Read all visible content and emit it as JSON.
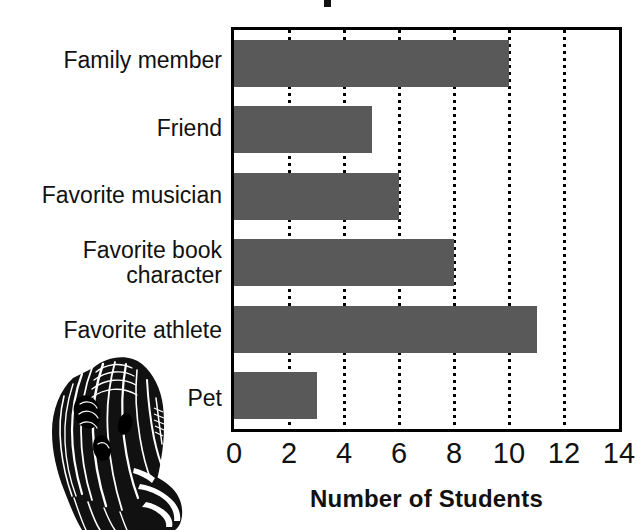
{
  "chart_data": {
    "type": "bar",
    "orientation": "horizontal",
    "title": "",
    "title_note": "title is cropped off the top edge of the screenshot; only a small letter fragment is visible",
    "categories": [
      "Family member",
      "Friend",
      "Favorite musician",
      "Favorite book\ncharacter",
      "Favorite athlete",
      "Pet"
    ],
    "values": [
      10,
      5,
      6,
      8,
      11,
      3
    ],
    "xlabel": "Number of Students",
    "ylabel": "",
    "xlim": [
      0,
      14
    ],
    "xticks": [
      0,
      2,
      4,
      6,
      8,
      10,
      12,
      14
    ],
    "xtick_labels": [
      "0",
      "2",
      "4",
      "6",
      "8",
      "10",
      "12",
      "14"
    ],
    "grid": "vertical-dotted",
    "legend": "none",
    "bar_color": "#595959",
    "frame_color": "#000000",
    "background": "#ffffff"
  },
  "illustration": {
    "name": "alice-woodcut-engraving",
    "description": "black-and-white woodcut engraving of a long-haired figure seen from behind"
  }
}
